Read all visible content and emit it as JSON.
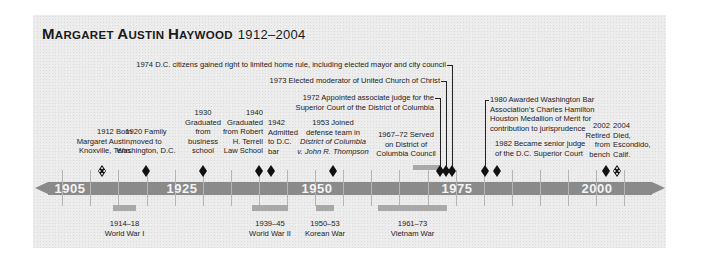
{
  "title": {
    "name_parts": [
      {
        "big": "M",
        "small": "ARGARET "
      },
      {
        "big": "A",
        "small": "USTIN "
      },
      {
        "big": "H",
        "small": "AYWOOD"
      }
    ],
    "years": "1912–2004"
  },
  "axis": {
    "year_labels": [
      {
        "label": "1905",
        "x": 70
      },
      {
        "label": "1925",
        "x": 182
      },
      {
        "label": "1950",
        "x": 317
      },
      {
        "label": "1975",
        "x": 457
      },
      {
        "label": "2000",
        "x": 597
      }
    ],
    "tick_xs": [
      62,
      90,
      118,
      147,
      175,
      203,
      231,
      259,
      287,
      315,
      343,
      371,
      399,
      428,
      456,
      484,
      512,
      540,
      568,
      596,
      624
    ],
    "color": "#8a8a8a"
  },
  "events": [
    {
      "year": 1912,
      "x": 102,
      "marker": "birth",
      "lines": [
        "1912 Born",
        "Margaret Austin,",
        "Knoxville, Tenn."
      ],
      "align": "r",
      "label_x": 132,
      "label_y": 127
    },
    {
      "year": 1920,
      "x": 146,
      "marker": "diamond",
      "lines": [
        "1920 Family",
        "moved to",
        "Washington, D.C."
      ],
      "align": "c",
      "label_x": 146,
      "label_y": 127
    },
    {
      "year": 1930,
      "x": 203,
      "marker": "diamond",
      "lines": [
        "1930",
        "Graduated",
        "from",
        "business",
        "school"
      ],
      "align": "c",
      "label_x": 203,
      "label_y": 108
    },
    {
      "year": 1940,
      "x": 259,
      "marker": "diamond",
      "lines": [
        "1940",
        "Graduated",
        "from Robert",
        "H. Terrell",
        "Law School"
      ],
      "align": "r",
      "label_x": 263,
      "label_y": 108
    },
    {
      "year": 1942,
      "x": 271,
      "marker": "diamond",
      "lines": [
        "1942",
        "Admitted",
        "to D.C.",
        "bar"
      ],
      "align": "l",
      "label_x": 268,
      "label_y": 118
    },
    {
      "year": 1953,
      "x": 333,
      "marker": "diamond",
      "lines": [
        "1953 Joined",
        "defense team in",
        "District of Columbia",
        "v. John R. Thompson"
      ],
      "italic_lines": [
        2,
        3
      ],
      "align": "c",
      "label_x": 333,
      "label_y": 118
    },
    {
      "year": 1972,
      "x": 440,
      "marker": "diamond",
      "lines": [
        "1972 Appointed associate judge for the",
        "Superior Court of the District of Columbia"
      ],
      "align": "r",
      "label_x": 434,
      "label_y": 93,
      "leader_top": 98
    },
    {
      "year": 1973,
      "x": 446,
      "marker": "diamond",
      "lines": [
        "1973 Elected moderator of United Church of Christ"
      ],
      "align": "r",
      "label_x": 440,
      "label_y": 76,
      "leader_top": 81
    },
    {
      "year": 1974,
      "x": 452,
      "marker": "diamond",
      "lines": [
        "1974 D.C. citizens gained right to limited home rule, including elected mayor and city council"
      ],
      "align": "r",
      "label_x": 446,
      "label_y": 60,
      "leader_top": 65
    },
    {
      "year": 1980,
      "x": 485,
      "marker": "diamond",
      "lines": [
        "1980 Awarded Washington Bar",
        "Association’s Charles Hamilton",
        "Houston Medallion of Merit for",
        "contribution to jurisprudence"
      ],
      "align": "l",
      "label_x": 490,
      "label_y": 95,
      "leader_top": 100
    },
    {
      "year": 1982,
      "x": 497,
      "marker": "diamond",
      "lines": [
        "1982 Became senior judge",
        "of the D.C. Superior Court"
      ],
      "align": "l",
      "label_x": 495,
      "label_y": 139
    },
    {
      "year": 2002,
      "x": 606,
      "marker": "diamond",
      "lines": [
        "2002",
        "Retired",
        "from",
        "bench"
      ],
      "align": "r",
      "label_x": 610,
      "label_y": 121
    },
    {
      "year": 2004,
      "x": 617,
      "marker": "death",
      "lines": [
        "2004",
        "Died,",
        "Escondido,",
        "Calif."
      ],
      "align": "l",
      "label_x": 613,
      "label_y": 121
    }
  ],
  "council": {
    "lines": [
      "1967–72 Served",
      "on District of",
      "Columbia Council"
    ],
    "label_x": 406,
    "label_y": 130
  },
  "wars": [
    {
      "years": "1914–18",
      "name": "World War I",
      "x1": 113,
      "x2": 136
    },
    {
      "years": "1939–45",
      "name": "World War II",
      "x1": 252,
      "x2": 288
    },
    {
      "years": "1950–53",
      "name": "Korean War",
      "x1": 316,
      "x2": 334
    },
    {
      "years": "1961–73",
      "name": "Vietnam War",
      "x1": 378,
      "x2": 447
    }
  ]
}
